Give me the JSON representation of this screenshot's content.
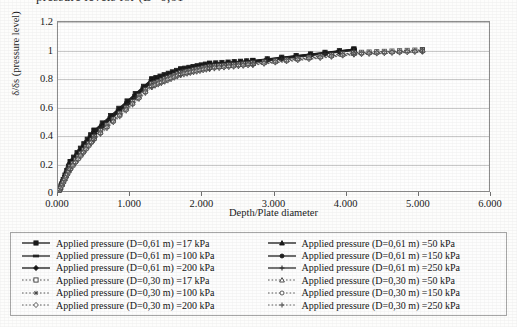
{
  "document": {
    "top_cutoff_text": "pressure levels for (D=0,61"
  },
  "chart_data": {
    "type": "line",
    "title": "",
    "xlabel": "Depth/Plate diameter",
    "ylabel": "δ/δs (pressure level)",
    "xlim": [
      0,
      6
    ],
    "ylim": [
      0,
      1.2
    ],
    "grid": true,
    "legend_position": "below-plot",
    "x_ticks": [
      "0.000",
      "1.000",
      "2.000",
      "3.000",
      "4.000",
      "5.000",
      "6.000"
    ],
    "x_tick_values": [
      0,
      1,
      2,
      3,
      4,
      5,
      6
    ],
    "y_ticks": [
      "0",
      "0.2",
      "0.4",
      "0.6",
      "0.8",
      "1",
      "1.2"
    ],
    "y_tick_values": [
      0,
      0.2,
      0.4,
      0.6,
      0.8,
      1,
      1.2
    ],
    "series": [
      {
        "name": "Applied pressure (D=0,61 m) =17 kPa",
        "plate": "D=0,61 m",
        "pressure": "17 kPa",
        "style": "solid",
        "marker": "square",
        "color": "#1a1a1a",
        "x": [
          0.0,
          0.17,
          0.5,
          1.3,
          1.7,
          2.1,
          2.7,
          4.1
        ],
        "y": [
          0.0,
          0.22,
          0.44,
          0.8,
          0.87,
          0.91,
          0.93,
          1.01
        ]
      },
      {
        "name": "Applied pressure (D=0,61 m) =50 kPa",
        "plate": "D=0,61 m",
        "pressure": "50 kPa",
        "style": "solid",
        "marker": "triangle",
        "color": "#1a1a1a",
        "x": [
          0.0,
          0.17,
          0.5,
          1.3,
          1.7,
          2.1,
          2.7,
          4.1
        ],
        "y": [
          0.0,
          0.21,
          0.43,
          0.795,
          0.865,
          0.905,
          0.928,
          1.008
        ]
      },
      {
        "name": "Applied pressure (D=0,61 m) =100 kPa",
        "plate": "D=0,61 m",
        "pressure": "100 kPa",
        "style": "solid",
        "marker": "dash",
        "color": "#222222",
        "x": [
          0.0,
          0.17,
          0.5,
          1.3,
          1.7,
          2.1,
          2.7,
          4.1
        ],
        "y": [
          0.0,
          0.205,
          0.425,
          0.79,
          0.862,
          0.902,
          0.925,
          1.006
        ]
      },
      {
        "name": "Applied pressure (D=0,61 m) =150 kPa",
        "plate": "D=0,61 m",
        "pressure": "150 kPa",
        "style": "solid",
        "marker": "circle",
        "color": "#1f1f1f",
        "x": [
          0.0,
          0.17,
          0.5,
          1.3,
          1.7,
          2.1,
          2.7,
          4.1
        ],
        "y": [
          0.0,
          0.2,
          0.42,
          0.785,
          0.858,
          0.899,
          0.922,
          1.004
        ]
      },
      {
        "name": "Applied pressure (D=0,61 m) =200 kPa",
        "plate": "D=0,61 m",
        "pressure": "200 kPa",
        "style": "solid",
        "marker": "diamond",
        "color": "#151515",
        "x": [
          0.0,
          0.17,
          0.5,
          1.3,
          1.7,
          2.1,
          2.7,
          4.1
        ],
        "y": [
          0.0,
          0.195,
          0.415,
          0.78,
          0.854,
          0.896,
          0.919,
          1.002
        ]
      },
      {
        "name": "Applied pressure (D=0,61 m) =250 kPa",
        "plate": "D=0,61 m",
        "pressure": "250 kPa",
        "style": "solid",
        "marker": "plus",
        "color": "#2b2b2b",
        "x": [
          0.0,
          0.17,
          0.5,
          1.3,
          1.7,
          2.1,
          2.7,
          4.1
        ],
        "y": [
          0.0,
          0.19,
          0.41,
          0.775,
          0.85,
          0.893,
          0.916,
          1.0
        ]
      },
      {
        "name": "Applied pressure (D=0,30 m) =17 kPa",
        "plate": "D=0,30 m",
        "pressure": "17 kPa",
        "style": "dotted",
        "marker": "square-open",
        "color": "#3a3a3a",
        "x": [
          0.0,
          0.17,
          0.5,
          1.3,
          1.7,
          2.1,
          2.7,
          4.1,
          5.05
        ],
        "y": [
          0.0,
          0.185,
          0.395,
          0.765,
          0.845,
          0.888,
          0.912,
          0.985,
          1.005
        ]
      },
      {
        "name": "Applied pressure (D=0,30 m) =50 kPa",
        "plate": "D=0,30 m",
        "pressure": "50 kPa",
        "style": "dotted",
        "marker": "triangle-open",
        "color": "#3f3f3f",
        "x": [
          0.0,
          0.17,
          0.5,
          1.3,
          1.7,
          2.1,
          2.7,
          4.1,
          5.05
        ],
        "y": [
          0.0,
          0.18,
          0.39,
          0.76,
          0.841,
          0.884,
          0.909,
          0.982,
          1.002
        ]
      },
      {
        "name": "Applied pressure (D=0,30 m) =100 kPa",
        "plate": "D=0,30 m",
        "pressure": "100 kPa",
        "style": "dotted",
        "marker": "star",
        "color": "#454545",
        "x": [
          0.0,
          0.17,
          0.5,
          1.3,
          1.7,
          2.1,
          2.7,
          4.1,
          5.05
        ],
        "y": [
          0.0,
          0.175,
          0.385,
          0.755,
          0.837,
          0.88,
          0.906,
          0.979,
          0.999
        ]
      },
      {
        "name": "Applied pressure (D=0,30 m) =150 kPa",
        "plate": "D=0,30 m",
        "pressure": "150 kPa",
        "style": "dotted",
        "marker": "circle-open",
        "color": "#484848",
        "x": [
          0.0,
          0.17,
          0.5,
          1.3,
          1.7,
          2.1,
          2.7,
          4.1,
          5.05
        ],
        "y": [
          0.0,
          0.17,
          0.38,
          0.75,
          0.833,
          0.876,
          0.903,
          0.976,
          0.996
        ]
      },
      {
        "name": "Applied pressure (D=0,30 m) =200 kPa",
        "plate": "D=0,30 m",
        "pressure": "200 kPa",
        "style": "dotted",
        "marker": "diamond-open",
        "color": "#4c4c4c",
        "x": [
          0.0,
          0.17,
          0.5,
          1.3,
          1.7,
          2.1,
          2.7,
          4.1,
          5.05
        ],
        "y": [
          0.0,
          0.165,
          0.375,
          0.745,
          0.829,
          0.872,
          0.9,
          0.973,
          0.993
        ]
      },
      {
        "name": "Applied pressure (D=0,30 m) =250 kPa",
        "plate": "D=0,30 m",
        "pressure": "250 kPa",
        "style": "dotted",
        "marker": "plus-open",
        "color": "#505050",
        "x": [
          0.0,
          0.17,
          0.5,
          1.3,
          1.7,
          2.1,
          2.7,
          4.1,
          5.05
        ],
        "y": [
          0.0,
          0.16,
          0.37,
          0.74,
          0.825,
          0.868,
          0.897,
          0.97,
          0.99
        ]
      }
    ]
  },
  "legend": {
    "left_column": [
      "Applied pressure (D=0,61 m) =17 kPa",
      "Applied pressure (D=0,61 m) =100 kPa",
      "Applied pressure (D=0,61 m) =200 kPa",
      "Applied pressure (D=0,30 m) =17 kPa",
      "Applied pressure (D=0,30 m) =100 kPa",
      "Applied pressure (D=0,30 m) =200 kPa"
    ],
    "right_column": [
      "Applied pressure (D=0,61 m) =50 kPa",
      "Applied pressure (D=0,61 m) =150 kPa",
      "Applied pressure (D=0,61 m) =250 kPa",
      "Applied pressure (D=0,30 m) =50 kPa",
      "Applied pressure (D=0,30 m) =150 kPa",
      "Applied pressure (D=0,30 m) =250 kPa"
    ]
  }
}
